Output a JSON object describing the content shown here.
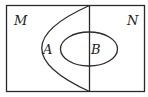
{
  "diagram": {
    "type": "venn",
    "labels": {
      "M": "M",
      "N": "N",
      "A": "A",
      "B": "B"
    },
    "colors": {
      "stroke": "#2a2a2a",
      "background": "#ffffff"
    }
  }
}
